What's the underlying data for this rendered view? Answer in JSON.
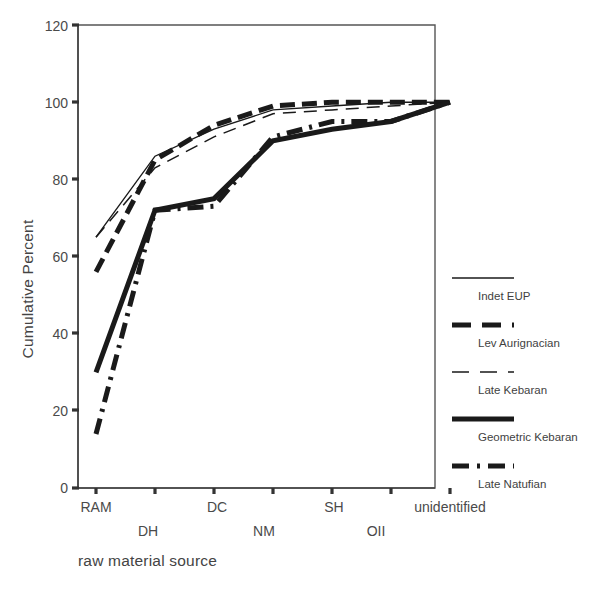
{
  "chart_data": {
    "type": "line",
    "title": "",
    "xlabel": "raw material source",
    "ylabel": "Cumulative Percent",
    "categories": [
      "RAM",
      "DH",
      "DC",
      "NM",
      "SH",
      "OII",
      "unidentified"
    ],
    "ylim": [
      0,
      120
    ],
    "yticks": [
      0,
      20,
      40,
      60,
      80,
      100,
      120
    ],
    "grid": false,
    "legend_position": "right",
    "series": [
      {
        "name": "Indet EUP",
        "style": "thin-solid",
        "color": "#1a1a1a",
        "values": [
          65,
          86,
          93,
          98,
          99,
          100,
          100
        ]
      },
      {
        "name": "Lev Aurignacian",
        "style": "thick-dashed",
        "color": "#1a1a1a",
        "values": [
          56,
          85,
          94,
          99,
          100,
          100,
          100
        ]
      },
      {
        "name": "Late Kebaran",
        "style": "thin-dashed",
        "color": "#1a1a1a",
        "values": [
          65,
          83,
          91,
          97,
          98,
          99,
          100
        ]
      },
      {
        "name": "Geometric Kebaran",
        "style": "thick-solid",
        "color": "#1a1a1a",
        "values": [
          30,
          72,
          75,
          90,
          93,
          95,
          100
        ]
      },
      {
        "name": "Late Natufian",
        "style": "dash-dot",
        "color": "#1a1a1a",
        "values": [
          14,
          72,
          73,
          91,
          95,
          95,
          100
        ]
      }
    ]
  },
  "axes": {
    "y_tick_labels": [
      "120",
      "100",
      "80",
      "60",
      "40",
      "20",
      "0"
    ],
    "x_tick_labels": [
      "RAM",
      "DH",
      "DC",
      "NM",
      "SH",
      "OII",
      "unidentified"
    ],
    "y_axis_title": "Cumulative Percent",
    "x_axis_title": "raw material source"
  },
  "legend": {
    "entries": [
      {
        "label": "Indet EUP"
      },
      {
        "label": "Lev Aurignacian"
      },
      {
        "label": "Late Kebaran"
      },
      {
        "label": "Geometric Kebaran"
      },
      {
        "label": "Late Natufian"
      }
    ]
  }
}
